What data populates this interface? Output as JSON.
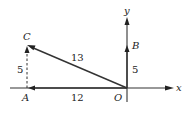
{
  "diagram": {
    "axes": {
      "x_label": "x",
      "y_label": "y",
      "origin_label": "O"
    },
    "points": {
      "A": {
        "label": "A",
        "coords": [
          -12,
          0
        ]
      },
      "B": {
        "label": "B",
        "coords": [
          0,
          5
        ]
      },
      "C": {
        "label": "C",
        "coords": [
          -12,
          5
        ]
      },
      "O": {
        "label": "O",
        "coords": [
          0,
          0
        ]
      }
    },
    "vectors": [
      {
        "name": "OA",
        "from": "O",
        "to": "A",
        "length_label": "12"
      },
      {
        "name": "OB",
        "from": "O",
        "to": "B",
        "length_label": "5"
      },
      {
        "name": "AC",
        "from": "A",
        "to": "C",
        "length_label": "5",
        "style": "dashed"
      },
      {
        "name": "OC",
        "from": "O",
        "to": "C",
        "length_label": "13"
      }
    ]
  }
}
